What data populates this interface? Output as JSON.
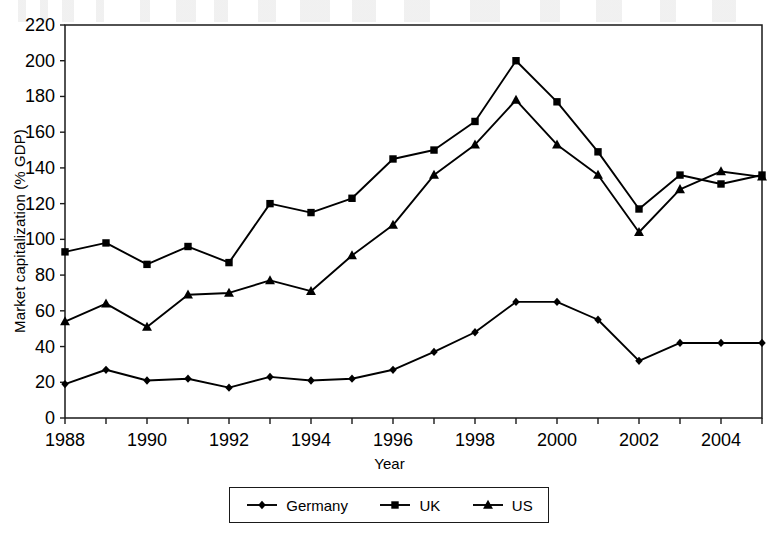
{
  "chart_data": {
    "type": "line",
    "title": "",
    "xlabel": "Year",
    "ylabel": "Market capitalization (% GDP)",
    "xlim": [
      1988,
      2005
    ],
    "ylim": [
      0,
      220
    ],
    "ytick_step": 20,
    "xtick_step": 1,
    "xtick_label_step": 2,
    "grid": false,
    "legend_position": "bottom",
    "yticks": [
      0,
      20,
      40,
      60,
      80,
      100,
      120,
      140,
      160,
      180,
      200,
      220
    ],
    "ytick_labels": [
      "0",
      "20",
      "40",
      "60",
      "80",
      "100",
      "120",
      "140",
      "160",
      "180",
      "200",
      "220"
    ],
    "x": [
      1988,
      1989,
      1990,
      1991,
      1992,
      1993,
      1994,
      1995,
      1996,
      1997,
      1998,
      1999,
      2000,
      2001,
      2002,
      2003,
      2004,
      2005
    ],
    "xtick_labels": [
      "1988",
      "",
      "1990",
      "",
      "1992",
      "",
      "1994",
      "",
      "1996",
      "",
      "1998",
      "",
      "2000",
      "",
      "2002",
      "",
      "2004",
      ""
    ],
    "categories": [
      "1988",
      "1989",
      "1990",
      "1991",
      "1992",
      "1993",
      "1994",
      "1995",
      "1996",
      "1997",
      "1998",
      "1999",
      "2000",
      "2001",
      "2002",
      "2003",
      "2004",
      "2005"
    ],
    "series": [
      {
        "name": "Germany",
        "marker": "diamond",
        "color": "#000000",
        "values": [
          19,
          27,
          21,
          22,
          17,
          23,
          21,
          22,
          27,
          37,
          48,
          65,
          65,
          55,
          32,
          42,
          42,
          42
        ]
      },
      {
        "name": "UK",
        "marker": "square",
        "color": "#000000",
        "values": [
          93,
          98,
          86,
          96,
          87,
          120,
          115,
          123,
          145,
          150,
          166,
          200,
          177,
          149,
          117,
          136,
          131,
          136
        ]
      },
      {
        "name": "US",
        "marker": "triangle",
        "color": "#000000",
        "values": [
          54,
          64,
          51,
          69,
          70,
          77,
          71,
          91,
          108,
          136,
          153,
          178,
          153,
          136,
          104,
          128,
          138,
          135
        ]
      }
    ]
  },
  "legend": {
    "items": [
      {
        "label": "Germany",
        "marker": "diamond"
      },
      {
        "label": "UK",
        "marker": "square"
      },
      {
        "label": "US",
        "marker": "triangle"
      }
    ]
  }
}
